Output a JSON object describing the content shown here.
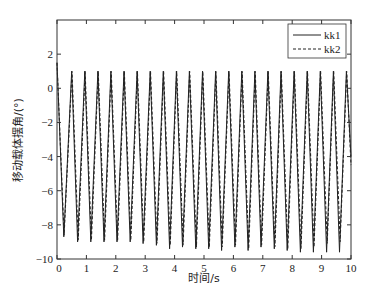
{
  "chart_data": {
    "type": "line",
    "title": "",
    "xlabel": "时间/s",
    "ylabel": "移动载体摆角/(°)",
    "xlim": [
      0,
      10
    ],
    "ylim": [
      -10,
      4
    ],
    "xticks": [
      0,
      1,
      2,
      3,
      4,
      5,
      6,
      7,
      8,
      9,
      10
    ],
    "yticks": [
      -10,
      -8,
      -6,
      -4,
      -2,
      0,
      2
    ],
    "xtick_labels": [
      "0",
      "1",
      "2",
      "3",
      "4",
      "5",
      "6",
      "7",
      "8",
      "9",
      "10"
    ],
    "ytick_labels": [
      "−10",
      "−8",
      "−6",
      "−4",
      "−2",
      "0",
      "2"
    ],
    "grid": false,
    "legend_position": "upper right",
    "period_s": 0.445,
    "peak_value": 1.0,
    "series": [
      {
        "name": "kk1",
        "style": "solid",
        "color": "#222222",
        "x": [
          0,
          0.23,
          0.5,
          0.7,
          0.945,
          1.15,
          1.39,
          1.6,
          1.835,
          2.04,
          2.28,
          2.49,
          2.725,
          2.93,
          3.17,
          3.38,
          3.615,
          3.83,
          4.06,
          4.27,
          4.505,
          4.72,
          4.95,
          5.16,
          5.395,
          5.6,
          5.84,
          6.05,
          6.285,
          6.5,
          6.73,
          6.94,
          7.175,
          7.39,
          7.62,
          7.83,
          8.065,
          8.28,
          8.51,
          8.72,
          8.955,
          9.17,
          9.4,
          9.61,
          9.845,
          10
        ],
        "y": [
          1.5,
          -8.7,
          1.0,
          -9.0,
          1.0,
          -9.0,
          1.0,
          -9.0,
          1.0,
          -9.0,
          1.0,
          -9.0,
          1.0,
          -9.1,
          1.0,
          -9.2,
          1.0,
          -9.4,
          1.0,
          -9.3,
          1.0,
          -9.4,
          1.0,
          -9.4,
          1.0,
          -9.5,
          1.0,
          -9.3,
          1.0,
          -9.5,
          1.0,
          -9.3,
          1.0,
          -9.4,
          1.0,
          -9.5,
          1.0,
          -9.6,
          1.0,
          -9.6,
          1.0,
          -9.6,
          1.0,
          -9.6,
          1.0,
          -4.0
        ]
      },
      {
        "name": "kk2",
        "style": "dashed",
        "color": "#222222",
        "x": [
          0,
          0.24,
          0.51,
          0.72,
          0.955,
          1.17,
          1.4,
          1.62,
          1.845,
          2.06,
          2.29,
          2.51,
          2.735,
          2.95,
          3.18,
          3.4,
          3.625,
          3.85,
          4.07,
          4.29,
          4.515,
          4.74,
          4.96,
          5.18,
          5.405,
          5.62,
          5.85,
          6.07,
          6.295,
          6.52,
          6.74,
          6.96,
          7.185,
          7.41,
          7.63,
          7.85,
          8.075,
          8.3,
          8.52,
          8.74,
          8.965,
          9.19,
          9.41,
          9.63,
          9.855,
          10
        ],
        "y": [
          1.5,
          -8.6,
          1.0,
          -8.9,
          1.0,
          -8.9,
          1.0,
          -8.9,
          1.0,
          -8.9,
          1.0,
          -8.9,
          1.0,
          -9.0,
          1.0,
          -9.1,
          1.0,
          -9.2,
          1.0,
          -9.2,
          1.0,
          -9.3,
          1.0,
          -9.3,
          1.0,
          -9.3,
          1.0,
          -9.2,
          1.0,
          -9.4,
          1.0,
          -9.2,
          1.0,
          -9.3,
          1.0,
          -9.4,
          1.0,
          -9.4,
          1.0,
          -9.3,
          1.0,
          -9.1,
          1.0,
          -9.0,
          1.0,
          -4.5
        ]
      }
    ]
  }
}
